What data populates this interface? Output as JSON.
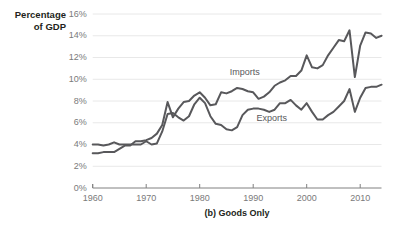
{
  "chart_data": {
    "type": "line",
    "title": "",
    "caption": "(b) Goods Only",
    "ylabel": "Percentage\nof GDP",
    "xlabel": "",
    "xlim": [
      1960,
      2014
    ],
    "ylim": [
      0,
      16
    ],
    "grid": true,
    "grid_axis": "y",
    "legend": "inline-annotations",
    "line_color": "#58585b",
    "grid_color": "#e8e8e8",
    "axis_color": "#808080",
    "tick_label_color": "#7a7a7a",
    "ytick_labels": [
      "0%",
      "2%",
      "4%",
      "6%",
      "8%",
      "10%",
      "12%",
      "14%",
      "16%"
    ],
    "ytick_values": [
      0,
      2,
      4,
      6,
      8,
      10,
      12,
      14,
      16
    ],
    "xtick_labels": [
      "1960",
      "1970",
      "1980",
      "1990",
      "2000",
      "2010"
    ],
    "xtick_values": [
      1960,
      1970,
      1980,
      1990,
      2000,
      2010
    ],
    "x": [
      1960,
      1961,
      1962,
      1963,
      1964,
      1965,
      1966,
      1967,
      1968,
      1969,
      1970,
      1971,
      1972,
      1973,
      1974,
      1975,
      1976,
      1977,
      1978,
      1979,
      1980,
      1981,
      1982,
      1983,
      1984,
      1985,
      1986,
      1987,
      1988,
      1989,
      1990,
      1991,
      1992,
      1993,
      1994,
      1995,
      1996,
      1997,
      1998,
      1999,
      2000,
      2001,
      2002,
      2003,
      2004,
      2005,
      2006,
      2007,
      2008,
      2009,
      2010,
      2011,
      2012,
      2013,
      2014
    ],
    "series": [
      {
        "name": "Imports",
        "label": "Imports",
        "label_x": 1989,
        "label_y": 10.6,
        "values": [
          3.2,
          3.2,
          3.3,
          3.3,
          3.3,
          3.6,
          3.9,
          3.9,
          4.3,
          4.3,
          4.4,
          4.6,
          5.0,
          5.8,
          7.9,
          6.5,
          7.3,
          7.9,
          8.0,
          8.5,
          8.8,
          8.3,
          7.6,
          7.7,
          8.8,
          8.7,
          8.9,
          9.2,
          9.1,
          8.9,
          8.8,
          8.2,
          8.4,
          8.8,
          9.4,
          9.7,
          9.9,
          10.3,
          10.3,
          10.8,
          12.2,
          11.1,
          11.0,
          11.3,
          12.2,
          12.9,
          13.6,
          13.5,
          14.5,
          10.2,
          13.1,
          14.3,
          14.2,
          13.8,
          14.0
        ]
      },
      {
        "name": "Exports",
        "label": "Exports",
        "label_x": 1994,
        "label_y": 6.3,
        "values": [
          4.0,
          4.0,
          3.9,
          4.0,
          4.2,
          4.0,
          4.0,
          4.0,
          4.0,
          4.0,
          4.3,
          4.0,
          4.1,
          5.2,
          6.8,
          6.9,
          6.5,
          6.2,
          6.6,
          7.7,
          8.3,
          7.8,
          6.6,
          5.9,
          5.8,
          5.4,
          5.3,
          5.6,
          6.7,
          7.2,
          7.3,
          7.3,
          7.2,
          7.0,
          7.2,
          7.8,
          7.8,
          8.1,
          7.6,
          7.2,
          7.8,
          7.0,
          6.3,
          6.3,
          6.7,
          7.0,
          7.5,
          8.0,
          9.1,
          7.0,
          8.3,
          9.2,
          9.3,
          9.3,
          9.5
        ]
      }
    ]
  }
}
